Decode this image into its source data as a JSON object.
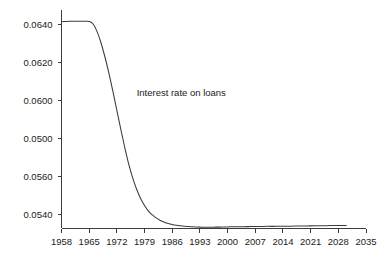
{
  "chart_data": {
    "type": "line",
    "title": "",
    "xlabel": "",
    "ylabel": "",
    "grid": false,
    "legend": "none",
    "annotations": [
      {
        "text": "Interest rate on loans",
        "x": 1977,
        "y": 0.0602
      }
    ],
    "xlim": [
      1958,
      2035
    ],
    "ylim": [
      0.0528,
      0.0647
    ],
    "xticks": [
      1958,
      1965,
      1972,
      1979,
      1986,
      1993,
      2000,
      2007,
      2014,
      2021,
      2028,
      2035
    ],
    "xtick_labels": [
      "1958",
      "1965",
      "1972",
      "1979",
      "1986",
      "1993",
      "2000",
      "2007",
      "2014",
      "2021",
      "2028",
      "2035"
    ],
    "yticks": [
      0.064,
      0.062,
      0.06,
      0.058,
      0.056,
      0.054
    ],
    "ytick_labels": [
      "0.0640",
      "0.0620",
      "0.0600",
      "0.0500",
      "0.0560",
      "0.0540"
    ],
    "series": [
      {
        "name": "Interest rate on loans",
        "color": "#3a3a3a",
        "x": [
          1958,
          1959,
          1960,
          1961,
          1962,
          1963,
          1964,
          1965,
          1966,
          1967,
          1968,
          1969,
          1970,
          1971,
          1972,
          1973,
          1974,
          1975,
          1976,
          1977,
          1978,
          1979,
          1980,
          1981,
          1982,
          1983,
          1984,
          1985,
          1986,
          1987,
          1988,
          1989,
          1990,
          1991,
          1992,
          1993,
          1994,
          1995,
          1996,
          1997,
          1998,
          1999,
          2000,
          2002,
          2004,
          2006,
          2008,
          2010,
          2012,
          2014,
          2016,
          2018,
          2020,
          2022,
          2024,
          2026,
          2028,
          2030
        ],
        "y": [
          0.06412,
          0.06413,
          0.06414,
          0.06414,
          0.06414,
          0.06414,
          0.06414,
          0.06413,
          0.064,
          0.0636,
          0.063,
          0.06225,
          0.0614,
          0.06045,
          0.05945,
          0.05845,
          0.0575,
          0.05662,
          0.0559,
          0.0553,
          0.05482,
          0.05445,
          0.05415,
          0.05395,
          0.05378,
          0.05366,
          0.05357,
          0.0535,
          0.05345,
          0.05341,
          0.05338,
          0.05336,
          0.05334,
          0.05333,
          0.05332,
          0.05331,
          0.0533,
          0.0533,
          0.0533,
          0.05331,
          0.05331,
          0.05332,
          0.05332,
          0.05333,
          0.05333,
          0.05334,
          0.05334,
          0.05335,
          0.05335,
          0.05336,
          0.05336,
          0.05337,
          0.05337,
          0.05338,
          0.05338,
          0.05339,
          0.05339,
          0.0534
        ]
      }
    ]
  }
}
